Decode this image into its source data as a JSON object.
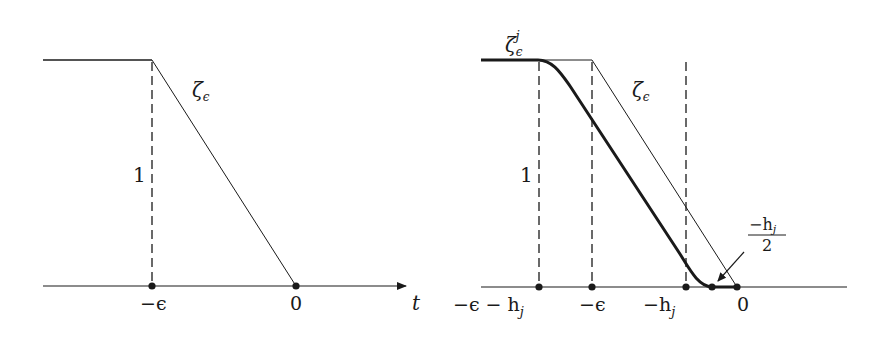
{
  "figure": {
    "left_panel": {
      "curve_label": "ζ",
      "curve_label_sub": "ϵ",
      "height_label": "1",
      "axis_label": "t",
      "ticks": [
        {
          "label": "−ϵ",
          "x": 152
        },
        {
          "label": "0",
          "x": 296
        }
      ]
    },
    "right_panel": {
      "smooth_curve_label": "ζ",
      "smooth_curve_label_sub": "ϵ",
      "smooth_curve_label_sup": "j",
      "ramp_label": "ζ",
      "ramp_label_sub": "ϵ",
      "height_label": "1",
      "ticks": [
        {
          "label_main": "−ϵ − h",
          "label_sub": "j",
          "x": 539
        },
        {
          "label_main": "−ϵ",
          "label_sub": "",
          "x": 592
        },
        {
          "label_main": "−h",
          "label_sub": "j",
          "x": 686
        },
        {
          "label_main": "0",
          "label_sub": "",
          "x": 737
        }
      ],
      "annotation": {
        "numerator": "−h",
        "numerator_sub": "j",
        "denominator": "2",
        "points_to_x": 712
      }
    },
    "colors": {
      "stroke": "#1a1a1a",
      "background": "#ffffff"
    }
  }
}
